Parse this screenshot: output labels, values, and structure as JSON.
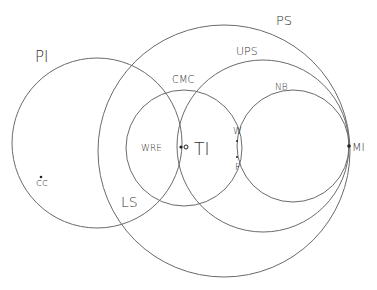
{
  "diagram": {
    "type": "euler-diagram",
    "stroke_color": "#6a6a6a",
    "circles": [
      {
        "id": "PI",
        "label": "PI",
        "cx": 97,
        "cy": 143,
        "r": 85,
        "label_x": 35,
        "label_y": 62,
        "label_size": 15
      },
      {
        "id": "PS",
        "label": "PS",
        "cx": 224,
        "cy": 151,
        "r": 126,
        "label_x": 276,
        "label_y": 25,
        "label_size": 13
      },
      {
        "id": "CMC",
        "label": "CMC",
        "cx": 184,
        "cy": 148,
        "r": 58,
        "label_x": 172,
        "label_y": 83,
        "label_size": 10
      },
      {
        "id": "UPS",
        "label": "UPS",
        "cx": 263,
        "cy": 146,
        "r": 86,
        "label_x": 236,
        "label_y": 55,
        "label_size": 11
      },
      {
        "id": "NB",
        "label": "NB",
        "cx": 293,
        "cy": 146,
        "r": 56,
        "label_x": 275,
        "label_y": 90,
        "label_size": 9
      }
    ],
    "labels": [
      {
        "id": "LS",
        "text": "LS",
        "x": 121,
        "y": 207,
        "size": 14
      },
      {
        "id": "WRE",
        "text": "WRE",
        "x": 141,
        "y": 151,
        "size": 9
      },
      {
        "id": "TI",
        "text": "TI",
        "x": 194,
        "y": 155,
        "size": 17
      },
      {
        "id": "W",
        "text": "W",
        "x": 233,
        "y": 134,
        "size": 9
      },
      {
        "id": "F",
        "text": "F",
        "x": 235,
        "y": 170,
        "size": 9
      },
      {
        "id": "MI",
        "text": "MI",
        "x": 352,
        "y": 151,
        "size": 11
      },
      {
        "id": "CC",
        "text": "cc",
        "x": 36,
        "y": 186,
        "size": 11
      }
    ],
    "points": [
      {
        "id": "CC-point",
        "x": 41,
        "y": 177,
        "kind": "filled",
        "r": 1.3
      },
      {
        "id": "TI-boundary-point",
        "x": 181,
        "y": 147,
        "kind": "filled",
        "r": 1.6
      },
      {
        "id": "TI-point",
        "x": 186,
        "y": 147,
        "kind": "open",
        "r": 2
      },
      {
        "id": "W-point",
        "x": 237,
        "y": 141,
        "kind": "filled",
        "r": 1
      },
      {
        "id": "F-point",
        "x": 237,
        "y": 157,
        "kind": "filled",
        "r": 1
      },
      {
        "id": "MI-point",
        "x": 349,
        "y": 146,
        "kind": "filled",
        "r": 1.8
      }
    ]
  }
}
